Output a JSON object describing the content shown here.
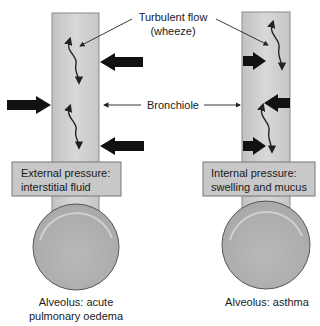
{
  "labels": {
    "turbulent_line1": "Turbulent flow",
    "turbulent_line2": "(wheeze)",
    "bronchiole": "Bronchiole"
  },
  "left_panel": {
    "box_line1": "External pressure:",
    "box_line2": "interstitial fluid",
    "caption_line1": "Alveolus: acute",
    "caption_line2": "pulmonary oedema"
  },
  "right_panel": {
    "box_line1": "Internal pressure:",
    "box_line2": "swelling and mucus",
    "caption_line1": "Alveolus: asthma"
  },
  "colors": {
    "tube_fill": "#cfcfcf",
    "tube_stroke": "#8a8a8a",
    "box_fill": "#c8c8c8",
    "alveolus_fill": "#b4b4b4",
    "arrow": "#111111"
  }
}
